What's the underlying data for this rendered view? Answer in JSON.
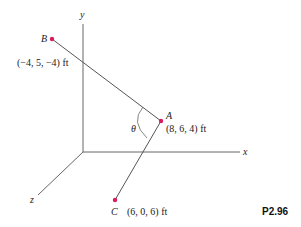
{
  "axes": {
    "x": "x",
    "y": "y",
    "z": "z"
  },
  "points": {
    "A": {
      "label": "A",
      "coords": "(8, 6, 4) ft"
    },
    "B": {
      "label": "B",
      "coords": "(−4, 5, −4) ft"
    },
    "C": {
      "label": "C",
      "coords": "(6, 0, 6) ft"
    }
  },
  "angle_label": "θ",
  "figure_id": "P2.96",
  "colors": {
    "point": "#d81b60",
    "line": "#555555"
  }
}
